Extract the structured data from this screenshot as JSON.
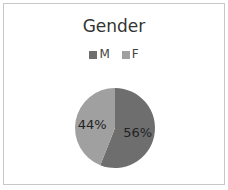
{
  "chart_data": {
    "type": "pie",
    "title": "Gender",
    "categories": [
      "M",
      "F"
    ],
    "values": [
      56,
      44
    ],
    "labels": [
      "56%",
      "44%"
    ],
    "colors": [
      "#6e6e6e",
      "#a0a0a0"
    ],
    "legend_position": "top"
  }
}
